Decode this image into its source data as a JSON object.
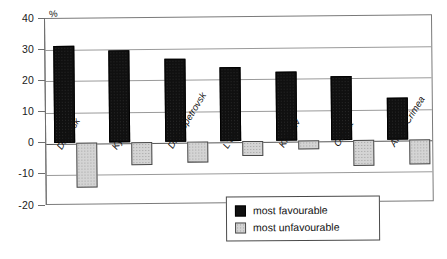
{
  "chart_data": {
    "type": "bar",
    "title": "",
    "subtitle": "",
    "xlabel": "",
    "ylabel": "%",
    "unit_label": "%",
    "ylim": [
      -20,
      40
    ],
    "yticks": [
      40,
      30,
      20,
      10,
      0,
      -10,
      -20
    ],
    "ytick_labels": [
      "40",
      "30",
      "20",
      "10",
      "0",
      "-10",
      "-20"
    ],
    "grid": true,
    "legend_position": "inside-bottom-center",
    "categories": [
      "Donetsk",
      "Kyiv",
      "Dnipropetrovsk",
      "L'viv",
      "Kharkiv",
      "Odesa",
      "AR of Crimea"
    ],
    "series": [
      {
        "name": "most favourable",
        "color": "#101010",
        "values": [
          31,
          29.5,
          26.5,
          23.5,
          22,
          20.5,
          13.5
        ]
      },
      {
        "name": "most unfavourable",
        "color": "#d4d4d4",
        "values": [
          -14.5,
          -7.5,
          -7,
          -5,
          -3,
          -8.5,
          -8
        ]
      }
    ]
  },
  "legend": {
    "items": [
      {
        "label": "most favourable",
        "swatch": "fav"
      },
      {
        "label": "most unfavourable",
        "swatch": "unfav"
      }
    ]
  }
}
